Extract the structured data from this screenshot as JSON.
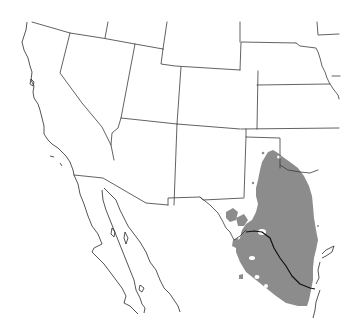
{
  "map": {
    "type": "species range map",
    "region": "Southwestern United States and northern Mexico",
    "background_color": "#ffffff",
    "border_color": "#3a3a3a",
    "range_fill_color": "#8c8c8c",
    "river_color": "#111111",
    "legend": null,
    "labels": []
  }
}
